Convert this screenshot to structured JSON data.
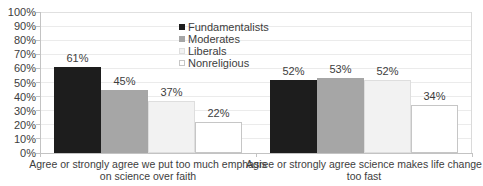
{
  "chart_data": {
    "type": "bar",
    "title": "",
    "xlabel": "",
    "ylabel": "",
    "grid": true,
    "legend_position": "top-center-inside",
    "categories": [
      {
        "lines": [
          "Agree or strongly agree we put too much emphasis",
          "on science over faith"
        ]
      },
      {
        "lines": [
          "Agree or strongly agree science makes life change",
          "too fast"
        ]
      }
    ],
    "series": [
      {
        "name": "Fundamentalists",
        "values": [
          61,
          52
        ],
        "labels": [
          "61%",
          "52%"
        ],
        "fill": "#1d1d1d",
        "border": "#1d1d1d"
      },
      {
        "name": "Moderates",
        "values": [
          45,
          53
        ],
        "labels": [
          "45%",
          "53%"
        ],
        "fill": "#a6a6a6",
        "border": "#a6a6a6"
      },
      {
        "name": "Liberals",
        "values": [
          37,
          52
        ],
        "labels": [
          "37%",
          "52%"
        ],
        "fill": "#f2f2f2",
        "border": "#dedede"
      },
      {
        "name": "Nonreligious",
        "values": [
          22,
          34
        ],
        "labels": [
          "22%",
          "34%"
        ],
        "fill": "#ffffff",
        "border": "#c6c6c6"
      }
    ],
    "y_axis": {
      "min": 0,
      "max": 100,
      "step": 10,
      "tick_labels": [
        "0%",
        "10%",
        "20%",
        "30%",
        "40%",
        "50%",
        "60%",
        "70%",
        "80%",
        "90%",
        "100%"
      ]
    },
    "colors": {
      "background": "#ffffff",
      "gridline": "#ebebeb",
      "axis_line": "#c3c3c3",
      "plot_border": "#dddddd",
      "text": "#3d3d3d"
    }
  }
}
